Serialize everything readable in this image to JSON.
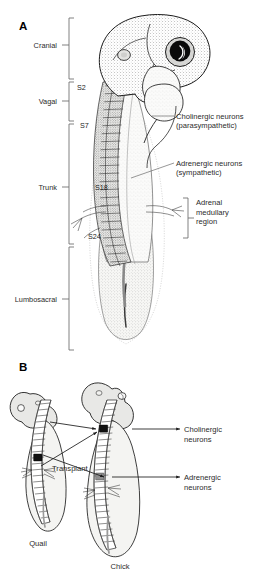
{
  "figure": {
    "panels": [
      {
        "letter": "A",
        "name": "neural-crest-fate-map",
        "axial_brackets": [
          {
            "label": "Cranial",
            "y_top": 18,
            "y_bottom": 79,
            "tick_y": 45
          },
          {
            "label": "Vagal",
            "y_top": 82,
            "y_bottom": 121,
            "tick_y": 101
          },
          {
            "label": "Trunk",
            "y_top": 124,
            "y_bottom": 244,
            "tick_y": 187
          },
          {
            "label": "Lumbosacral",
            "y_top": 247,
            "y_bottom": 350,
            "tick_y": 299
          }
        ],
        "somite_labels": [
          {
            "text": "S2",
            "x": 77,
            "y": 90
          },
          {
            "text": "S7",
            "x": 80,
            "y": 128
          },
          {
            "text": "S18",
            "x": 95,
            "y": 190
          },
          {
            "text": "S24",
            "x": 88,
            "y": 239
          }
        ],
        "callouts": [
          {
            "line1": "Cholinergic neurons",
            "line2": "(parasympathetic)",
            "x": 176,
            "y": 118
          },
          {
            "line1": "Adrenergic neurons",
            "line2": "(sympathetic)",
            "x": 176,
            "y": 165
          }
        ],
        "region_bracket": {
          "label_lines": [
            "Adrenal",
            "medullary",
            "region"
          ],
          "x": 196,
          "y_top": 198,
          "y_bottom": 238
        }
      },
      {
        "letter": "B",
        "name": "quail-chick-transplant",
        "embryos": [
          {
            "name": "quail-embryo",
            "label": "Quail",
            "label_x": 38,
            "label_y": 543
          },
          {
            "name": "chick-embryo",
            "label": "Chick",
            "label_x": 120,
            "label_y": 566
          }
        ],
        "transplant_label": {
          "text": "Transplant",
          "x": 52,
          "y": 468
        },
        "callouts": [
          {
            "line1": "Cholinergic",
            "line2": "neurons",
            "x": 184,
            "y": 432
          },
          {
            "line1": "Adrenergic",
            "line2": "neurons",
            "x": 184,
            "y": 480
          }
        ]
      }
    ]
  },
  "colors": {
    "ink": "#1a1a1a",
    "bracket": "#6b6b6b",
    "body_fill": "#e8e8e6",
    "transplant": "#111111",
    "background": "#ffffff"
  }
}
